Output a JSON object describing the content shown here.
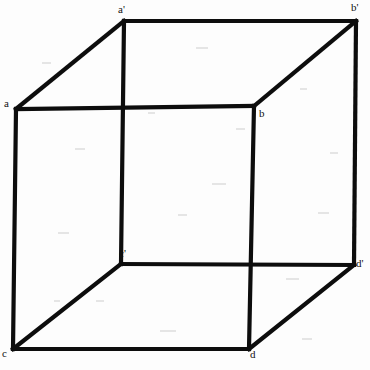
{
  "figure": {
    "type": "line-diagram",
    "width": 370,
    "height": 370,
    "background_color": "#fdfdfd",
    "stroke_color": "#0d0d0d",
    "stroke_width": 4.2,
    "label_color": "#111111",
    "label_font_size": 11
  },
  "vertices": [
    {
      "id": "a-prime",
      "label": "a'",
      "x": 124,
      "y": 21,
      "label_x": 118,
      "label_y": 4,
      "face": "back"
    },
    {
      "id": "b-prime",
      "label": "b'",
      "x": 356,
      "y": 21,
      "label_x": 351,
      "label_y": 2,
      "face": "back"
    },
    {
      "id": "c-prime",
      "label": "c'",
      "x": 121,
      "y": 264,
      "label_x": 119,
      "label_y": 248,
      "face": "back"
    },
    {
      "id": "d-prime",
      "label": "d'",
      "x": 354,
      "y": 265,
      "label_x": 356,
      "label_y": 258,
      "face": "back"
    },
    {
      "id": "a",
      "label": "a",
      "x": 16,
      "y": 109,
      "label_x": 4,
      "label_y": 98,
      "face": "front"
    },
    {
      "id": "b",
      "label": "b",
      "x": 254,
      "y": 106,
      "label_x": 259,
      "label_y": 108,
      "face": "front"
    },
    {
      "id": "c",
      "label": "c",
      "x": 13,
      "y": 349,
      "label_x": 2,
      "label_y": 348,
      "face": "front"
    },
    {
      "id": "d",
      "label": "d",
      "x": 249,
      "y": 349,
      "label_x": 250,
      "label_y": 349,
      "face": "front"
    }
  ],
  "edges": [
    {
      "id": "edge-a-b",
      "from": "a",
      "to": "b",
      "kind": "front-face"
    },
    {
      "id": "edge-b-d",
      "from": "b",
      "to": "d",
      "kind": "front-face"
    },
    {
      "id": "edge-d-c",
      "from": "d",
      "to": "c",
      "kind": "front-face"
    },
    {
      "id": "edge-c-a",
      "from": "c",
      "to": "a",
      "kind": "front-face"
    },
    {
      "id": "edge-ap-bp",
      "from": "a-prime",
      "to": "b-prime",
      "kind": "back-face"
    },
    {
      "id": "edge-bp-dp",
      "from": "b-prime",
      "to": "d-prime",
      "kind": "back-face"
    },
    {
      "id": "edge-dp-cp",
      "from": "d-prime",
      "to": "c-prime",
      "kind": "back-face"
    },
    {
      "id": "edge-cp-ap",
      "from": "c-prime",
      "to": "a-prime",
      "kind": "back-face"
    },
    {
      "id": "edge-a-ap",
      "from": "a",
      "to": "a-prime",
      "kind": "depth-connector"
    },
    {
      "id": "edge-b-bp",
      "from": "b",
      "to": "b-prime",
      "kind": "depth-connector"
    },
    {
      "id": "edge-c-cp",
      "from": "c",
      "to": "c-prime",
      "kind": "depth-connector"
    },
    {
      "id": "edge-d-dp",
      "from": "d",
      "to": "d-prime",
      "kind": "depth-connector"
    }
  ]
}
